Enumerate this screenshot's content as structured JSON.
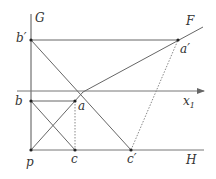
{
  "diagram": {
    "labels": {
      "G": "G",
      "F": "F",
      "H": "H",
      "b_prime": "b′",
      "a_prime": "a′",
      "b": "b",
      "a": "a",
      "x1_main": "x",
      "x1_sub": "1",
      "p": "p",
      "c": "c",
      "c_prime": "c′"
    },
    "points": {
      "b_prime": [
        31,
        40
      ],
      "a_prime": [
        178,
        40
      ],
      "b": [
        31,
        101
      ],
      "a": [
        75,
        101
      ],
      "p": [
        31,
        150
      ],
      "c": [
        75,
        150
      ],
      "c_prime": [
        131,
        150
      ],
      "F_end": [
        203,
        27
      ]
    },
    "colors": {
      "line": "#555555",
      "text": "#333333",
      "background": "#ffffff"
    }
  }
}
